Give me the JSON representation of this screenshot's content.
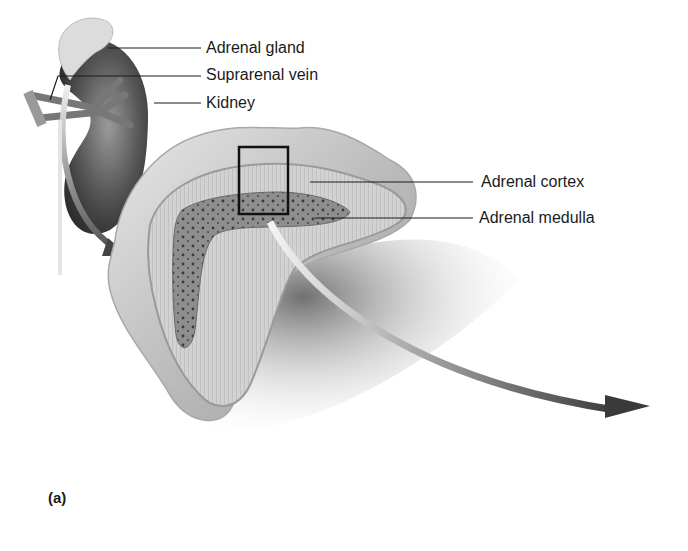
{
  "figure": {
    "panel_label": "(a)",
    "labels": [
      {
        "id": "adrenal-gland",
        "text": "Adrenal gland"
      },
      {
        "id": "suprarenal-vein",
        "text": "Suprarenal vein"
      },
      {
        "id": "kidney",
        "text": "Kidney"
      },
      {
        "id": "adrenal-cortex",
        "text": "Adrenal cortex"
      },
      {
        "id": "adrenal-medulla",
        "text": "Adrenal medulla"
      }
    ],
    "colors": {
      "ink": "#1a1a1a",
      "kidney": "#4a4a4a",
      "cortex": "#c9c9c9",
      "medulla": "#8a8a8a",
      "capsule": "#b8b8b8",
      "shadow": "#555555",
      "arrow_dark": "#3a3a3a"
    }
  }
}
